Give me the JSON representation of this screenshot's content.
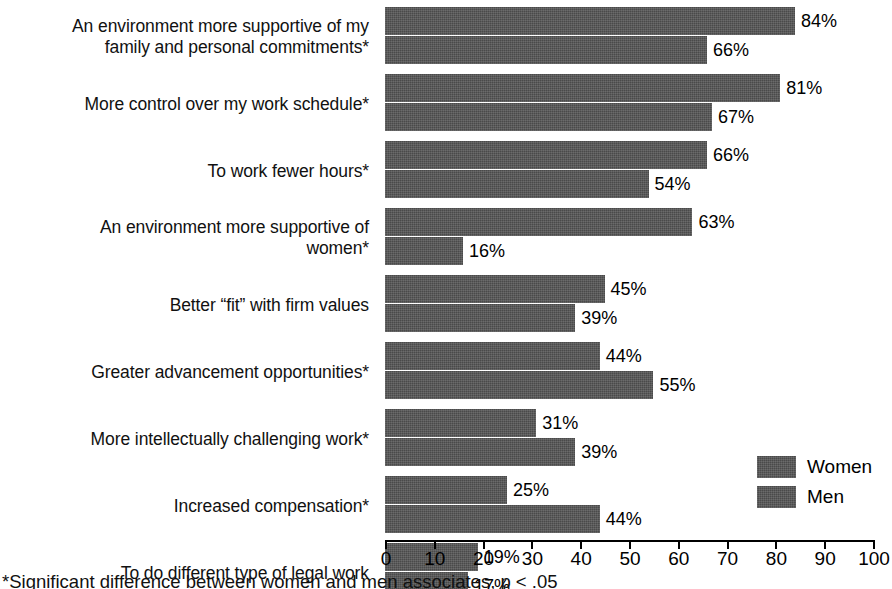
{
  "chart_data": {
    "type": "bar",
    "orientation": "horizontal",
    "title": "",
    "xlabel": "",
    "ylabel": "",
    "xlim": [
      0,
      100
    ],
    "xticks": [
      0,
      10,
      20,
      30,
      40,
      50,
      60,
      70,
      80,
      90,
      100
    ],
    "grid": false,
    "legend_position": "bottom-right",
    "value_suffix": "%",
    "bar_color": "#4a4a4a",
    "categories": [
      "An environment more supportive of my\nfamily and personal commitments*",
      "More control over my work schedule*",
      "To work fewer hours*",
      "An environment more supportive of\nwomen*",
      "Better “fit” with firm values",
      "Greater advancement opportunities*",
      "More intellectually challenging work*",
      "Increased compensation*",
      "To do different type of legal work"
    ],
    "series": [
      {
        "name": "Women",
        "values": [
          84,
          81,
          66,
          63,
          45,
          44,
          31,
          25,
          19
        ],
        "labels": [
          "84%",
          "81%",
          "66%",
          "63%",
          "45%",
          "44%",
          "31%",
          "25%",
          "19%"
        ]
      },
      {
        "name": "Men",
        "values": [
          66,
          67,
          54,
          16,
          39,
          55,
          39,
          44,
          17
        ],
        "labels": [
          "66%",
          "67%",
          "54%",
          "16%",
          "39%",
          "55%",
          "39%",
          "44%",
          "17%"
        ]
      }
    ],
    "xtick_labels": [
      "0",
      "10",
      "20",
      "30",
      "40",
      "50",
      "60",
      "70",
      "80",
      "90",
      "100"
    ],
    "footnote": "*Significant difference between women and men associates, p < .05"
  },
  "legend": {
    "items": [
      {
        "label": "Women"
      },
      {
        "label": "Men"
      }
    ]
  }
}
